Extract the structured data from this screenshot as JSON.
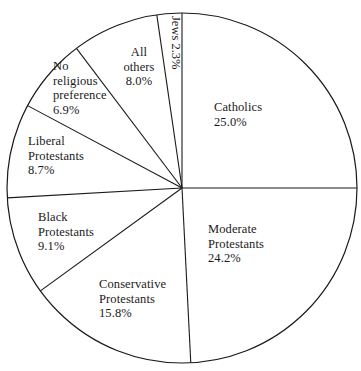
{
  "chart_data": {
    "type": "pie",
    "title": "",
    "subtitle": "",
    "xlabel": "",
    "ylabel": "",
    "legend_position": "none",
    "grid": false,
    "units": "percent",
    "start_angle_deg": 0,
    "direction": "clockwise",
    "categories": [
      "Catholics",
      "Moderate Protestants",
      "Conservative Protestants",
      "Black Protestants",
      "Liberal Protestants",
      "No religious preference",
      "All others",
      "Jews"
    ],
    "values": [
      25.0,
      24.2,
      15.8,
      9.1,
      8.7,
      6.9,
      8.0,
      2.3
    ],
    "slices": [
      {
        "name": "Catholics",
        "value": 25.0,
        "value_text": "25.0%",
        "label_line1": "Catholics",
        "label_line2": "",
        "label_line3": "",
        "rotated": false
      },
      {
        "name": "Moderate Protestants",
        "value": 24.2,
        "value_text": "24.2%",
        "label_line1": "Moderate",
        "label_line2": "Protestants",
        "label_line3": "",
        "rotated": false
      },
      {
        "name": "Conservative Protestants",
        "value": 15.8,
        "value_text": "15.8%",
        "label_line1": "Conservative",
        "label_line2": "Protestants",
        "label_line3": "",
        "rotated": false
      },
      {
        "name": "Black Protestants",
        "value": 9.1,
        "value_text": "9.1%",
        "label_line1": "Black",
        "label_line2": "Protestants",
        "label_line3": "",
        "rotated": false
      },
      {
        "name": "Liberal Protestants",
        "value": 8.7,
        "value_text": "8.7%",
        "label_line1": "Liberal",
        "label_line2": "Protestants",
        "label_line3": "",
        "rotated": false
      },
      {
        "name": "No religious preference",
        "value": 6.9,
        "value_text": "6.9%",
        "label_line1": "No",
        "label_line2": "religious",
        "label_line3": "preference",
        "rotated": false
      },
      {
        "name": "All others",
        "value": 8.0,
        "value_text": "8.0%",
        "label_line1": "All",
        "label_line2": "others",
        "label_line3": "",
        "rotated": false
      },
      {
        "name": "Jews",
        "value": 2.3,
        "value_text": "2.3%",
        "label_line1": "Jews",
        "label_line2": "",
        "label_line3": "",
        "rotated": true
      }
    ]
  },
  "labels": {
    "catholics": "Catholics\n25.0%",
    "moderate": "Moderate\nProtestants\n24.2%",
    "conservative": "Conservative\nProtestants\n15.8%",
    "black": "Black\nProtestants\n9.1%",
    "liberal": "Liberal\nProtestants\n8.7%",
    "no_religious": "No\nreligious\npreference\n6.9%",
    "all_others": "All\nothers\n8.0%",
    "jews": "Jews  2.3%"
  },
  "style": {
    "stroke_color": "#1a1a1a",
    "fill_color": "#ffffff",
    "text_color": "#1a1a1a"
  }
}
